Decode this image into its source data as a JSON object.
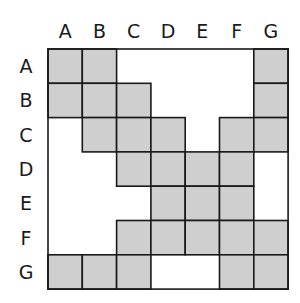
{
  "columns": [
    "A",
    "B",
    "C",
    "D",
    "E",
    "F",
    "G"
  ],
  "rows": [
    "A",
    "B",
    "C",
    "D",
    "E",
    "F",
    "G"
  ],
  "colors": {
    "filled": "#cfcfcf",
    "empty": "#ffffff",
    "line": "#1a1a1a"
  },
  "matrix": [
    [
      1,
      1,
      0,
      0,
      0,
      0,
      1
    ],
    [
      1,
      1,
      1,
      0,
      0,
      0,
      1
    ],
    [
      0,
      1,
      1,
      1,
      0,
      1,
      1
    ],
    [
      0,
      0,
      1,
      1,
      1,
      1,
      0
    ],
    [
      0,
      0,
      0,
      1,
      1,
      1,
      0
    ],
    [
      0,
      0,
      1,
      1,
      1,
      1,
      1
    ],
    [
      1,
      1,
      1,
      0,
      0,
      1,
      1
    ]
  ]
}
